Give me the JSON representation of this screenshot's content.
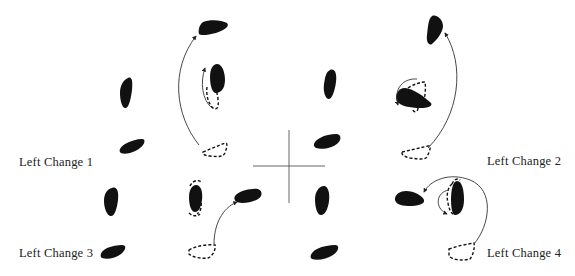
{
  "diagram": {
    "type": "dance-step foot placement diagram",
    "colors": {
      "foot_fill": "#111111",
      "path_stroke": "#333333",
      "label_text": "#222222",
      "background": "#ffffff"
    },
    "panels": [
      {
        "id": "left-change-1",
        "label": "Left Change 1",
        "position": "top-left"
      },
      {
        "id": "left-change-2",
        "label": "Left Change 2",
        "position": "top-right"
      },
      {
        "id": "left-change-3",
        "label": "Left Change 3",
        "position": "bottom-left"
      },
      {
        "id": "left-change-4",
        "label": "Left Change 4",
        "position": "bottom-right"
      }
    ],
    "legend": {
      "solid_foot": "foot position (weighted)",
      "dashed_foot": "starting foot position",
      "arrow": "direction of foot movement"
    },
    "center_marker": "crosshair"
  }
}
